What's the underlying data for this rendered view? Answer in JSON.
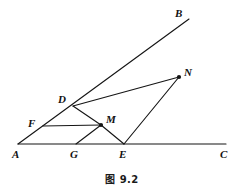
{
  "figure": {
    "caption": "图 9.2",
    "stroke_color": "#151515",
    "background_color": "#ffffff",
    "width": 244,
    "height": 194
  },
  "points": {
    "A": {
      "label": "A",
      "x": 18,
      "y": 144,
      "label_x": 12,
      "label_y": 149,
      "marker": false
    },
    "B": {
      "label": "B",
      "x": 189,
      "y": 19,
      "label_x": 175,
      "label_y": 8,
      "marker": false
    },
    "C": {
      "label": "C",
      "x": 226,
      "y": 144,
      "label_x": 220,
      "label_y": 149,
      "marker": false
    },
    "D": {
      "label": "D",
      "x": 73,
      "y": 106,
      "label_x": 58,
      "label_y": 94,
      "marker": false
    },
    "E": {
      "label": "E",
      "x": 124,
      "y": 144,
      "label_x": 119,
      "label_y": 149,
      "marker": false
    },
    "F": {
      "label": "F",
      "x": 43,
      "y": 126,
      "label_x": 28,
      "label_y": 118,
      "marker": false
    },
    "G": {
      "label": "G",
      "x": 76,
      "y": 144,
      "label_x": 70,
      "label_y": 149,
      "marker": false
    },
    "M": {
      "label": "M",
      "x": 101,
      "y": 125,
      "label_x": 106,
      "label_y": 114,
      "marker": true
    },
    "N": {
      "label": "N",
      "x": 179,
      "y": 77,
      "label_x": 184,
      "label_y": 67,
      "marker": true
    }
  },
  "segments": [
    {
      "name": "ray-AC",
      "from": "A",
      "to": "C"
    },
    {
      "name": "ray-AB",
      "from": "A",
      "to": "B"
    },
    {
      "name": "line-DN",
      "from": "D",
      "to": "N"
    },
    {
      "name": "line-DM",
      "from": "D",
      "to": "M"
    },
    {
      "name": "line-ME",
      "from": "M",
      "to": "E"
    },
    {
      "name": "line-EN",
      "from": "E",
      "to": "N"
    },
    {
      "name": "line-GM",
      "from": "G",
      "to": "M"
    },
    {
      "name": "line-FM",
      "from": "F",
      "to": "M"
    }
  ],
  "labels_order": [
    "A",
    "B",
    "C",
    "D",
    "E",
    "F",
    "G",
    "M",
    "N"
  ]
}
